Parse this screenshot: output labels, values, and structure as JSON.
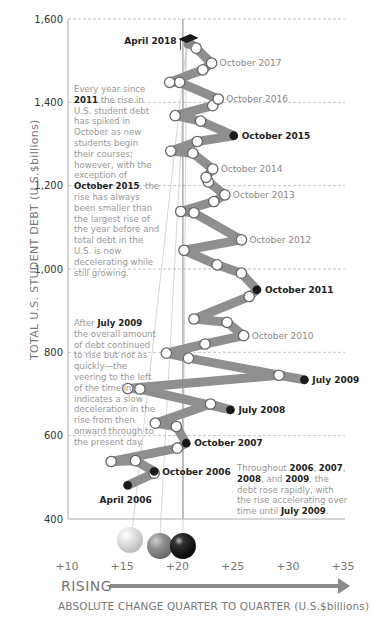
{
  "chart_data": {
    "type": "line",
    "title": "",
    "xlabel": "ABSOLUTE CHANGE QUARTER TO QUARTER (U.S.$billions)",
    "ylabel": "TOTAL U.S. STUDENT DEBT (U.S.$billions)",
    "x_ticks": [
      "+10",
      "+15",
      "+20",
      "+25",
      "+30",
      "+35"
    ],
    "y_ticks": [
      "400",
      "600",
      "800",
      "1,000",
      "1,200",
      "1,400",
      "1,600"
    ],
    "xlim": [
      10,
      35
    ],
    "ylim": [
      400,
      1600
    ],
    "grid": "horizontal dashed",
    "reference_line_x": 20.5,
    "points": [
      {
        "label": "April 2006",
        "x": 15.5,
        "y": 481,
        "marker": "dark"
      },
      {
        "label": "",
        "x": 17.9,
        "y": 510,
        "marker": "white"
      },
      {
        "label": "October 2006",
        "x": 17.9,
        "y": 514,
        "marker": "dark"
      },
      {
        "label": "",
        "x": 16.2,
        "y": 540,
        "marker": "white"
      },
      {
        "label": "",
        "x": 14.0,
        "y": 538,
        "marker": "white"
      },
      {
        "label": "",
        "x": 20.0,
        "y": 570,
        "marker": "white"
      },
      {
        "label": "October 2007",
        "x": 20.8,
        "y": 582,
        "marker": "dark"
      },
      {
        "label": "",
        "x": 19.9,
        "y": 622,
        "marker": "white"
      },
      {
        "label": "",
        "x": 18.0,
        "y": 630,
        "marker": "white"
      },
      {
        "label": "",
        "x": 23.0,
        "y": 676,
        "marker": "white"
      },
      {
        "label": "July 2008",
        "x": 24.8,
        "y": 662,
        "marker": "dark"
      },
      {
        "label": "",
        "x": 16.6,
        "y": 712,
        "marker": "white"
      },
      {
        "label": "",
        "x": 15.5,
        "y": 713,
        "marker": "white"
      },
      {
        "label": "",
        "x": 29.2,
        "y": 745,
        "marker": "white"
      },
      {
        "label": "July 2009",
        "x": 31.5,
        "y": 734,
        "marker": "dark"
      },
      {
        "label": "",
        "x": 21.0,
        "y": 786,
        "marker": "white"
      },
      {
        "label": "",
        "x": 19.0,
        "y": 798,
        "marker": "white"
      },
      {
        "label": "",
        "x": 22.5,
        "y": 820,
        "marker": "white"
      },
      {
        "label": "October 2010",
        "x": 26.0,
        "y": 840,
        "marker": "white"
      },
      {
        "label": "",
        "x": 24.5,
        "y": 872,
        "marker": "white"
      },
      {
        "label": "",
        "x": 21.5,
        "y": 880,
        "marker": "white"
      },
      {
        "label": "",
        "x": 26.5,
        "y": 934,
        "marker": "white"
      },
      {
        "label": "October 2011",
        "x": 27.2,
        "y": 950,
        "marker": "dark"
      },
      {
        "label": "",
        "x": 25.8,
        "y": 990,
        "marker": "white"
      },
      {
        "label": "",
        "x": 23.6,
        "y": 1010,
        "marker": "white"
      },
      {
        "label": "",
        "x": 20.6,
        "y": 1045,
        "marker": "white"
      },
      {
        "label": "October 2012",
        "x": 25.8,
        "y": 1070,
        "marker": "white"
      },
      {
        "label": "",
        "x": 21.5,
        "y": 1135,
        "marker": "white"
      },
      {
        "label": "",
        "x": 20.3,
        "y": 1138,
        "marker": "white"
      },
      {
        "label": "",
        "x": 23.3,
        "y": 1162,
        "marker": "white"
      },
      {
        "label": "October 2013",
        "x": 24.3,
        "y": 1178,
        "marker": "white"
      },
      {
        "label": "",
        "x": 22.8,
        "y": 1209,
        "marker": "white"
      },
      {
        "label": "",
        "x": 22.6,
        "y": 1220,
        "marker": "white"
      },
      {
        "label": "October 2014",
        "x": 23.2,
        "y": 1240,
        "marker": "white"
      },
      {
        "label": "",
        "x": 21.4,
        "y": 1278,
        "marker": "white"
      },
      {
        "label": "",
        "x": 19.4,
        "y": 1283,
        "marker": "white"
      },
      {
        "label": "",
        "x": 21.8,
        "y": 1306,
        "marker": "white"
      },
      {
        "label": "October 2015",
        "x": 25.1,
        "y": 1320,
        "marker": "dark"
      },
      {
        "label": "",
        "x": 22.1,
        "y": 1355,
        "marker": "white"
      },
      {
        "label": "",
        "x": 19.8,
        "y": 1368,
        "marker": "white"
      },
      {
        "label": "",
        "x": 23.2,
        "y": 1392,
        "marker": "white"
      },
      {
        "label": "October 2016",
        "x": 23.7,
        "y": 1408,
        "marker": "white"
      },
      {
        "label": "",
        "x": 20.2,
        "y": 1448,
        "marker": "white"
      },
      {
        "label": "",
        "x": 19.3,
        "y": 1448,
        "marker": "white"
      },
      {
        "label": "",
        "x": 22.3,
        "y": 1478,
        "marker": "white"
      },
      {
        "label": "October 2017",
        "x": 23.1,
        "y": 1494,
        "marker": "white"
      },
      {
        "label": "",
        "x": 21.7,
        "y": 1530,
        "marker": "white"
      },
      {
        "label": "April 2018",
        "x": 21.0,
        "y": 1545,
        "marker": "graduation-cap"
      }
    ],
    "annotations": [
      "Every year since 2011 the rise in U.S. student debt has spiked in October as new students begin their courses; however, with the exception of October 2015, the rise has always been smaller than the largest rise of the year before and total debt in the U.S. is now decelerating while still growing.",
      "After July 2009 the overall amount of debt continued to rise but not as quickly—the veering to the left of the timeline indicates a slow deceleration in the rise from then onward through to the present day.",
      "Throughout 2006, 2007, 2008, and 2009, the debt rose rapidly, with the rise accelerating over time until July 2009."
    ],
    "legend": [
      {
        "label": "sphere-light",
        "color": "#d4d4d4"
      },
      {
        "label": "sphere-mid",
        "color": "#8a8a8a"
      },
      {
        "label": "sphere-dark",
        "color": "#1a1a1a"
      }
    ]
  },
  "axes": {
    "y_title": "TOTAL U.S. STUDENT DEBT (U.S.$billions)",
    "x_title": "ABSOLUTE CHANGE QUARTER TO QUARTER (U.S.$billions)",
    "rising_label": "RISING"
  },
  "notes": {
    "top": {
      "p1": "Every year since ",
      "b1": "2011",
      "p2": " the rise in U.S. student debt has spiked in October as new students begin their courses; however, with the exception of ",
      "b2": "October 2015",
      "p3": ", the rise has always been smaller than the largest rise of the year before and total debt in the U.S. is now decelerating while still growing."
    },
    "middle": {
      "p1": "After ",
      "b1": "July 2009",
      "p2": " the overall amount of debt continued to rise but not as quickly—the veering to the left of the timeline indicates a slow deceleration in the rise from then onward through to the present day."
    },
    "bottom": {
      "p1": "Throughout ",
      "b1": "2006",
      "p2": ", ",
      "b2": "2007",
      "p3": ", ",
      "b3": "2008",
      "p4": ", and ",
      "b4": "2009",
      "p5": ", the debt rose rapidly, with the rise accelerating over time until ",
      "b5": "July 2009",
      "p6": "."
    }
  },
  "colors": {
    "ribbon": "#8f8f8f",
    "grid": "#aaaaaa",
    "axis": "#777777",
    "dark_marker": "#1a1a1a",
    "arrow": "#8a8a8a"
  }
}
